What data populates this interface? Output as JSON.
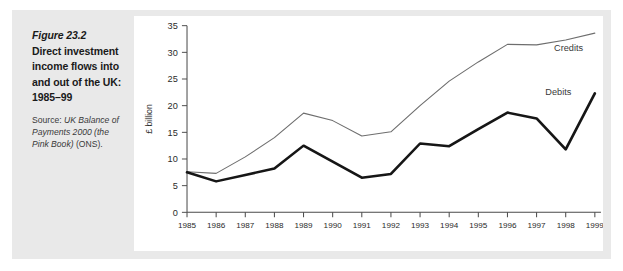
{
  "caption": {
    "figure_number": "Figure 23.2",
    "title_lines": [
      "Direct investment",
      "income flows into",
      "and out of the UK:",
      "1985–99"
    ],
    "source_label": "Source:",
    "source_text": "UK Balance of Payments 2000 (the Pink Book)",
    "source_suffix": "(ONS)."
  },
  "colors": {
    "panel_background": "#e9e9e9",
    "plot_background": "#ffffff",
    "credits_line": "#6e6e6e",
    "debits_line": "#161616",
    "axis": "#4a4a4a",
    "text": "#1a1a1a"
  },
  "chart_data": {
    "type": "line",
    "title": "",
    "xlabel": "",
    "ylabel": "£ billion",
    "categories": [
      "1985",
      "1986",
      "1987",
      "1988",
      "1989",
      "1990",
      "1991",
      "1992",
      "1993",
      "1994",
      "1995",
      "1996",
      "1997",
      "1998",
      "1999"
    ],
    "yticks": [
      0,
      5,
      10,
      15,
      20,
      25,
      30,
      35
    ],
    "ylim": [
      0,
      35
    ],
    "grid": false,
    "legend_position": "inline-right",
    "series": [
      {
        "name": "Credits",
        "values": [
          7.6,
          7.3,
          10.4,
          14.0,
          18.6,
          17.2,
          14.3,
          15.1,
          20.0,
          24.6,
          28.2,
          31.5,
          31.4,
          32.3,
          33.6
        ],
        "label_x_index": 12.6,
        "label_y_value": 30.2
      },
      {
        "name": "Debits",
        "values": [
          7.5,
          5.8,
          7.0,
          8.2,
          12.5,
          9.5,
          6.5,
          7.2,
          12.9,
          12.4,
          15.6,
          18.7,
          17.6,
          11.8,
          22.3
        ],
        "label_x_index": 12.3,
        "label_y_value": 22.0
      }
    ]
  }
}
